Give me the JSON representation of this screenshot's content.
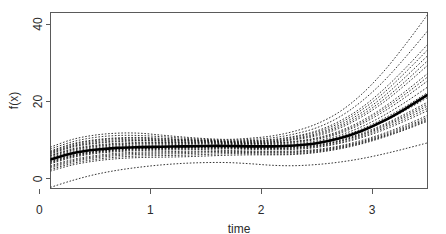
{
  "chart_data": {
    "type": "line",
    "title": "",
    "xlabel": "time",
    "ylabel": "f(x)",
    "xlim": [
      0.1,
      3.5
    ],
    "ylim": [
      -2.5,
      43
    ],
    "xticks": [
      0,
      1,
      2,
      3
    ],
    "xtick_labels": [
      "0",
      "1",
      "2",
      "3"
    ],
    "yticks": [
      0,
      20,
      40
    ],
    "ytick_labels": [
      "0",
      "20",
      "40"
    ],
    "grid": false,
    "legend": "none",
    "x": [
      0.1,
      0.3,
      0.5,
      0.7,
      0.9,
      1.1,
      1.3,
      1.5,
      1.7,
      1.9,
      2.1,
      2.3,
      2.5,
      2.7,
      2.9,
      3.1,
      3.3,
      3.5
    ],
    "series": [
      {
        "name": "posterior-mean",
        "style": "solid-thick",
        "values": [
          5.0,
          6.6,
          7.5,
          8.0,
          8.2,
          8.3,
          8.4,
          8.5,
          8.5,
          8.4,
          8.4,
          8.6,
          9.2,
          10.4,
          12.3,
          14.9,
          18.1,
          21.7
        ]
      },
      {
        "name": "posterior-draw-01",
        "style": "dotted",
        "values": [
          -2.2,
          -0.4,
          1.1,
          2.2,
          3.0,
          3.6,
          4.0,
          4.2,
          4.2,
          3.9,
          3.5,
          3.4,
          3.7,
          4.3,
          5.2,
          6.4,
          7.8,
          9.3
        ]
      },
      {
        "name": "posterior-draw-02",
        "style": "dotted",
        "values": [
          2.0,
          3.6,
          4.6,
          5.2,
          5.5,
          5.6,
          5.7,
          5.9,
          6.1,
          6.2,
          6.2,
          6.3,
          6.8,
          7.7,
          9.0,
          10.7,
          12.7,
          14.9
        ]
      },
      {
        "name": "posterior-draw-03",
        "style": "dotted",
        "values": [
          2.8,
          4.4,
          5.4,
          6.0,
          6.3,
          6.4,
          6.5,
          6.7,
          6.8,
          6.8,
          6.7,
          6.8,
          7.2,
          8.1,
          9.4,
          11.1,
          13.2,
          15.5
        ]
      },
      {
        "name": "posterior-draw-04",
        "style": "dotted",
        "values": [
          3.4,
          5.0,
          6.0,
          6.6,
          6.9,
          7.0,
          7.1,
          7.2,
          7.3,
          7.2,
          7.1,
          7.2,
          7.6,
          8.5,
          9.9,
          11.7,
          13.9,
          16.4
        ]
      },
      {
        "name": "posterior-draw-05",
        "style": "dotted",
        "values": [
          3.9,
          5.5,
          6.5,
          7.0,
          7.3,
          7.4,
          7.5,
          7.6,
          7.7,
          7.6,
          7.5,
          7.6,
          8.1,
          9.1,
          10.6,
          12.6,
          15.0,
          17.6
        ]
      },
      {
        "name": "posterior-draw-06",
        "style": "dotted",
        "values": [
          4.3,
          5.9,
          6.9,
          7.4,
          7.7,
          7.8,
          7.9,
          8.0,
          8.0,
          7.9,
          7.8,
          8.0,
          8.5,
          9.6,
          11.2,
          13.4,
          16.0,
          18.8
        ]
      },
      {
        "name": "posterior-draw-07",
        "style": "dotted",
        "values": [
          4.6,
          6.2,
          7.1,
          7.6,
          7.9,
          8.0,
          8.1,
          8.2,
          8.2,
          8.1,
          8.1,
          8.3,
          8.8,
          9.9,
          11.7,
          14.0,
          16.8,
          19.8
        ]
      },
      {
        "name": "posterior-draw-08",
        "style": "dotted",
        "values": [
          4.9,
          6.5,
          7.4,
          7.9,
          8.1,
          8.2,
          8.3,
          8.4,
          8.4,
          8.3,
          8.3,
          8.5,
          9.1,
          10.3,
          12.2,
          14.7,
          17.7,
          21.0
        ]
      },
      {
        "name": "posterior-draw-09",
        "style": "dotted",
        "values": [
          5.2,
          6.8,
          7.7,
          8.2,
          8.4,
          8.5,
          8.6,
          8.7,
          8.7,
          8.6,
          8.6,
          8.8,
          9.5,
          10.8,
          12.8,
          15.5,
          18.7,
          22.3
        ]
      },
      {
        "name": "posterior-draw-10",
        "style": "dotted",
        "values": [
          5.5,
          7.1,
          8.0,
          8.5,
          8.7,
          8.8,
          8.9,
          9.0,
          8.9,
          8.8,
          8.8,
          9.1,
          9.8,
          11.2,
          13.4,
          16.3,
          19.8,
          23.7
        ]
      },
      {
        "name": "posterior-draw-11",
        "style": "dotted",
        "values": [
          5.8,
          7.4,
          8.3,
          8.8,
          9.0,
          9.1,
          9.1,
          9.2,
          9.1,
          9.0,
          9.0,
          9.4,
          10.2,
          11.7,
          14.1,
          17.3,
          21.1,
          25.3
        ]
      },
      {
        "name": "posterior-draw-12",
        "style": "dotted",
        "values": [
          6.1,
          7.8,
          8.7,
          9.2,
          9.4,
          9.4,
          9.4,
          9.4,
          9.3,
          9.2,
          9.3,
          9.7,
          10.6,
          12.3,
          14.9,
          18.4,
          22.6,
          27.2
        ]
      },
      {
        "name": "posterior-draw-13",
        "style": "dotted",
        "values": [
          6.4,
          8.2,
          9.1,
          9.6,
          9.8,
          9.7,
          9.6,
          9.6,
          9.4,
          9.4,
          9.5,
          10.1,
          11.1,
          13.0,
          15.9,
          19.7,
          24.3,
          29.3
        ]
      },
      {
        "name": "posterior-draw-14",
        "style": "dotted",
        "values": [
          6.8,
          8.6,
          9.6,
          10.1,
          10.2,
          10.1,
          9.9,
          9.8,
          9.6,
          9.6,
          9.8,
          10.5,
          11.7,
          13.8,
          17.0,
          21.2,
          26.3,
          31.8
        ]
      },
      {
        "name": "posterior-draw-15",
        "style": "dotted",
        "values": [
          7.2,
          9.1,
          10.1,
          10.6,
          10.7,
          10.5,
          10.2,
          10.0,
          9.8,
          9.9,
          10.2,
          11.0,
          12.4,
          14.8,
          18.3,
          23.0,
          28.6,
          34.7
        ]
      },
      {
        "name": "posterior-draw-16",
        "style": "dotted",
        "values": [
          7.7,
          9.6,
          10.7,
          11.2,
          11.2,
          10.9,
          10.5,
          10.2,
          10.0,
          10.2,
          10.6,
          11.6,
          13.2,
          15.9,
          19.9,
          25.1,
          31.4,
          38.2
        ]
      },
      {
        "name": "posterior-draw-17",
        "style": "dotted",
        "values": [
          8.2,
          10.2,
          11.3,
          11.8,
          11.8,
          11.3,
          10.8,
          10.4,
          10.2,
          10.5,
          11.1,
          12.3,
          14.2,
          17.2,
          21.7,
          27.6,
          34.7,
          42.4
        ]
      },
      {
        "name": "posterior-draw-18",
        "style": "dotted",
        "values": [
          4.1,
          5.7,
          6.7,
          7.2,
          7.5,
          7.6,
          7.7,
          7.8,
          7.9,
          7.8,
          7.7,
          7.8,
          8.3,
          9.3,
          10.9,
          13.0,
          15.5,
          18.2
        ]
      },
      {
        "name": "posterior-draw-19",
        "style": "dotted",
        "values": [
          5.0,
          6.6,
          7.6,
          8.0,
          8.3,
          8.4,
          8.5,
          8.6,
          8.6,
          8.5,
          8.4,
          8.6,
          9.2,
          10.4,
          12.4,
          14.9,
          18.0,
          21.4
        ]
      },
      {
        "name": "posterior-draw-20",
        "style": "dotted",
        "values": [
          6.0,
          7.6,
          8.5,
          9.0,
          9.2,
          9.3,
          9.3,
          9.3,
          9.2,
          9.1,
          9.2,
          9.6,
          10.4,
          12.0,
          14.5,
          17.9,
          21.9,
          26.3
        ]
      },
      {
        "name": "posterior-draw-21",
        "style": "dotted",
        "values": [
          3.1,
          4.7,
          5.7,
          6.3,
          6.6,
          6.7,
          6.8,
          7.0,
          7.1,
          7.0,
          6.9,
          7.0,
          7.4,
          8.3,
          9.6,
          11.4,
          13.5,
          15.9
        ]
      },
      {
        "name": "posterior-draw-22",
        "style": "dotted",
        "values": [
          6.6,
          8.4,
          9.3,
          9.8,
          9.9,
          9.9,
          9.8,
          9.7,
          9.5,
          9.5,
          9.6,
          10.3,
          11.4,
          13.4,
          16.4,
          20.4,
          25.2,
          30.5
        ]
      },
      {
        "name": "posterior-draw-23",
        "style": "dotted",
        "values": [
          4.4,
          6.0,
          7.0,
          7.5,
          7.8,
          7.9,
          8.0,
          8.1,
          8.1,
          8.0,
          7.9,
          8.1,
          8.6,
          9.7,
          11.4,
          13.7,
          16.4,
          19.3
        ]
      },
      {
        "name": "posterior-draw-24",
        "style": "dotted",
        "values": [
          7.0,
          8.9,
          9.9,
          10.4,
          10.5,
          10.3,
          10.1,
          9.9,
          9.7,
          9.8,
          10.0,
          10.8,
          12.1,
          14.3,
          17.7,
          22.1,
          27.5,
          33.3
        ]
      },
      {
        "name": "posterior-draw-25",
        "style": "dotted",
        "values": [
          2.4,
          4.0,
          5.0,
          5.6,
          5.9,
          6.0,
          6.1,
          6.3,
          6.5,
          6.5,
          6.4,
          6.5,
          7.0,
          7.9,
          9.2,
          10.9,
          12.9,
          15.2
        ]
      }
    ]
  }
}
